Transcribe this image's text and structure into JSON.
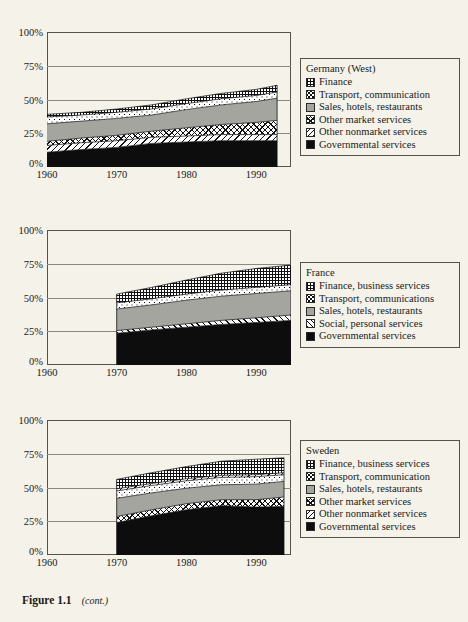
{
  "figure": {
    "caption_label": "Figure 1.1",
    "caption_note": "(cont.)"
  },
  "colors": {
    "page_background": "#f4f2e9",
    "axis": "#55524a",
    "gridline": "#8c887e",
    "sales_gray": "#a5a5a0",
    "governmental_black": "#0d0d0d",
    "ink": "#1a1a1a"
  },
  "charts": [
    {
      "id": "germany",
      "legend_title": "Germany (West)",
      "y_ticks": [
        "100%",
        "75%",
        "50%",
        "25%",
        "0%"
      ],
      "x_ticks": [
        "1960",
        "1970",
        "1980",
        "1990"
      ],
      "legend": [
        {
          "label": "Finance",
          "swatch": "sw-finance",
          "icon": "grid-pattern-swatch"
        },
        {
          "label": "Transport, communication",
          "swatch": "sw-transport",
          "icon": "dot-pattern-swatch"
        },
        {
          "label": "Sales, hotels, restaurants",
          "swatch": "sw-sales",
          "icon": "solid-gray-swatch"
        },
        {
          "label": "Other market services",
          "swatch": "sw-othermarket",
          "icon": "crosshatch-pattern-swatch"
        },
        {
          "label": "Other nonmarket services",
          "swatch": "sw-nonmarket",
          "icon": "diagonal-hatch-swatch"
        },
        {
          "label": "Governmental services",
          "swatch": "sw-gov",
          "icon": "solid-black-swatch"
        }
      ],
      "chart_data": {
        "type": "area",
        "title": "Germany (West)",
        "xlabel": "",
        "ylabel": "",
        "xlim": [
          1960,
          1995
        ],
        "ylim": [
          0,
          100
        ],
        "grid": true,
        "legend_position": "right",
        "stacked": true,
        "x": [
          1960,
          1965,
          1970,
          1975,
          1980,
          1985,
          1990,
          1993
        ],
        "series": [
          {
            "name": "Governmental services",
            "values": [
              11.0,
              13.0,
              14.5,
              17.5,
              18.5,
              19.5,
              19.5,
              19.5
            ]
          },
          {
            "name": "Other nonmarket services",
            "values": [
              5.0,
              5.0,
              5.0,
              4.5,
              4.5,
              4.5,
              4.5,
              4.5
            ]
          },
          {
            "name": "Other market services",
            "values": [
              3.0,
              3.5,
              4.0,
              4.5,
              6.0,
              7.5,
              9.0,
              10.5
            ]
          },
          {
            "name": "Sales, hotels, restaurants",
            "values": [
              13.0,
              12.5,
              12.5,
              12.0,
              13.5,
              14.5,
              15.5,
              16.5
            ]
          },
          {
            "name": "Transport, communication",
            "values": [
              5.0,
              4.5,
              4.5,
              4.5,
              4.5,
              4.5,
              4.5,
              4.5
            ]
          },
          {
            "name": "Finance",
            "values": [
              2.0,
              2.0,
              2.5,
              3.0,
              3.5,
              4.0,
              4.5,
              5.0
            ]
          }
        ]
      }
    },
    {
      "id": "france",
      "legend_title": "France",
      "y_ticks": [
        "100%",
        "75%",
        "50%",
        "25%",
        "0%"
      ],
      "x_ticks": [
        "1960",
        "1970",
        "1980",
        "1990"
      ],
      "legend": [
        {
          "label": "Finance, business services",
          "swatch": "sw-finance",
          "icon": "grid-pattern-swatch"
        },
        {
          "label": "Transport, communications",
          "swatch": "sw-transport",
          "icon": "dot-pattern-swatch"
        },
        {
          "label": "Sales, hotels, restaurants",
          "swatch": "sw-sales",
          "icon": "solid-gray-swatch"
        },
        {
          "label": "Social, personal services",
          "swatch": "sw-social",
          "icon": "diagonal-hatch-swatch"
        },
        {
          "label": "Governmental services",
          "swatch": "sw-gov",
          "icon": "solid-black-swatch"
        }
      ],
      "chart_data": {
        "type": "area",
        "title": "France",
        "xlabel": "",
        "ylabel": "",
        "xlim": [
          1960,
          1995
        ],
        "ylim": [
          0,
          100
        ],
        "grid": true,
        "legend_position": "right",
        "stacked": true,
        "x": [
          1970,
          1975,
          1980,
          1985,
          1990,
          1995
        ],
        "series": [
          {
            "name": "Governmental services",
            "values": [
              23.5,
              26.0,
              28.0,
              30.0,
              31.5,
              33.0
            ]
          },
          {
            "name": "Social, personal services",
            "values": [
              2.0,
              2.0,
              2.5,
              3.0,
              3.5,
              4.0
            ]
          },
          {
            "name": "Sales, hotels, restaurants",
            "values": [
              16.0,
              16.5,
              17.5,
              18.0,
              18.0,
              18.0
            ]
          },
          {
            "name": "Transport, communications",
            "values": [
              4.5,
              4.5,
              4.5,
              4.5,
              4.5,
              4.5
            ]
          },
          {
            "name": "Finance, business services",
            "values": [
              6.5,
              8.5,
              10.5,
              12.5,
              14.0,
              14.5
            ]
          }
        ]
      }
    },
    {
      "id": "sweden",
      "legend_title": "Sweden",
      "y_ticks": [
        "100%",
        "75%",
        "50%",
        "25%",
        "0%"
      ],
      "x_ticks": [
        "1960",
        "1970",
        "1980",
        "1990"
      ],
      "legend": [
        {
          "label": "Finance, business services",
          "swatch": "sw-finance",
          "icon": "grid-pattern-swatch"
        },
        {
          "label": "Transport, communication",
          "swatch": "sw-transport",
          "icon": "dot-pattern-swatch"
        },
        {
          "label": "Sales, hotels, restaurants",
          "swatch": "sw-sales",
          "icon": "solid-gray-swatch"
        },
        {
          "label": "Other market services",
          "swatch": "sw-othermarket",
          "icon": "crosshatch-pattern-swatch"
        },
        {
          "label": "Other nonmarket services",
          "swatch": "sw-nonmarket",
          "icon": "diagonal-hatch-swatch"
        },
        {
          "label": "Governmental services",
          "swatch": "sw-gov",
          "icon": "solid-black-swatch"
        }
      ],
      "chart_data": {
        "type": "area",
        "title": "Sweden",
        "xlabel": "",
        "ylabel": "",
        "xlim": [
          1960,
          1995
        ],
        "ylim": [
          0,
          100
        ],
        "grid": true,
        "legend_position": "right",
        "stacked": true,
        "x": [
          1970,
          1975,
          1980,
          1985,
          1990,
          1994
        ],
        "series": [
          {
            "name": "Governmental services",
            "values": [
              24.0,
              29.0,
              33.5,
              36.5,
              35.5,
              36.0
            ]
          },
          {
            "name": "Other market services",
            "values": [
              4.5,
              4.5,
              4.5,
              4.5,
              5.5,
              7.0
            ]
          },
          {
            "name": "Sales, hotels, restaurants",
            "values": [
              13.5,
              12.5,
              11.5,
              11.0,
              11.5,
              11.5
            ]
          },
          {
            "name": "Transport, communication",
            "values": [
              5.5,
              5.5,
              5.5,
              5.5,
              5.5,
              5.0
            ]
          },
          {
            "name": "Other nonmarket services",
            "values": [
              1.5,
              1.5,
              1.5,
              1.5,
              1.5,
              1.5
            ]
          },
          {
            "name": "Finance, business services",
            "values": [
              7.0,
              8.0,
              9.0,
              10.5,
              11.5,
              11.0
            ]
          }
        ]
      }
    }
  ]
}
